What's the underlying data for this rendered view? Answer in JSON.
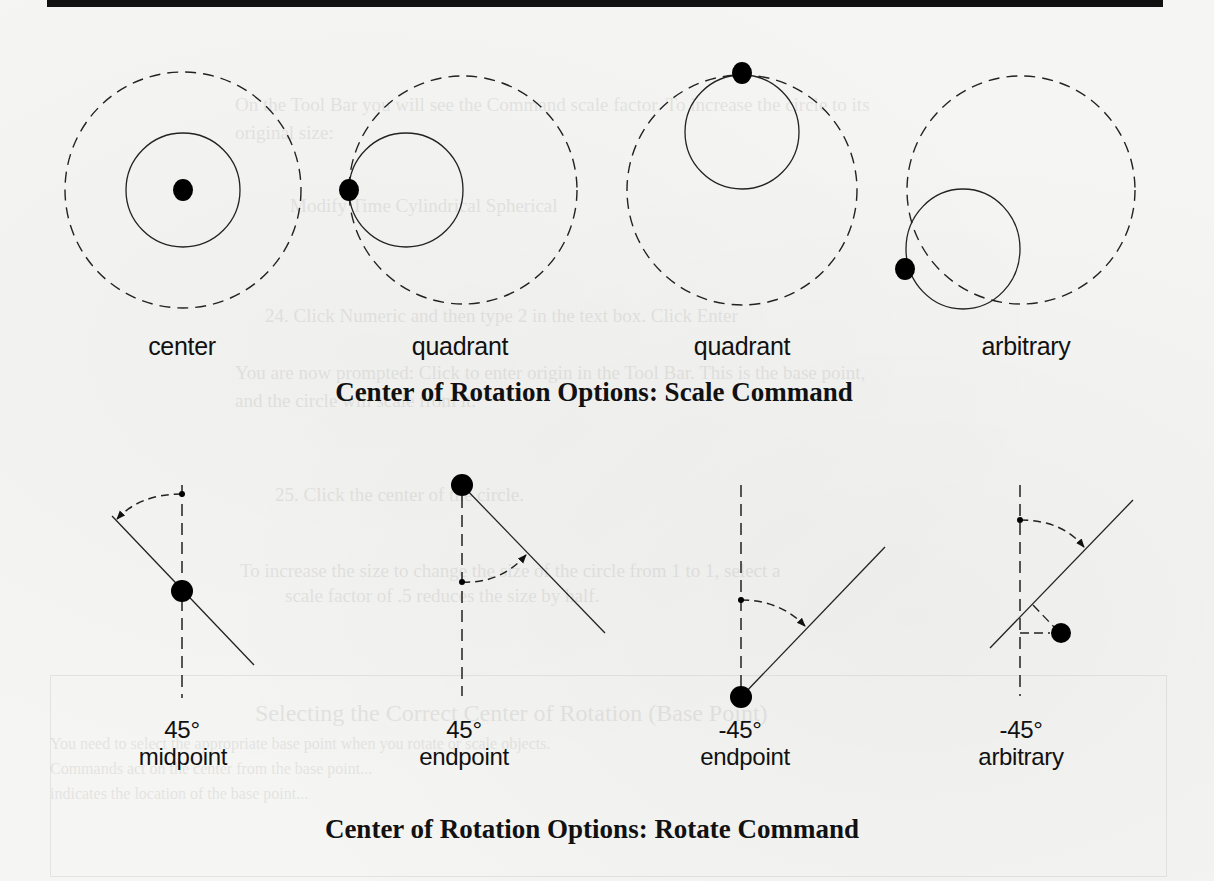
{
  "scale_section": {
    "title": "Center of Rotation Options: Scale Command",
    "figures": [
      {
        "label": "center",
        "outer_circle": {
          "cx": 183,
          "cy": 190,
          "r": 118
        },
        "inner_circle": {
          "cx": 183,
          "cy": 190,
          "r": 57
        },
        "base_point": {
          "x": 183,
          "y": 190
        }
      },
      {
        "label": "quadrant",
        "outer_circle": {
          "cx": 463,
          "cy": 190,
          "r": 114
        },
        "inner_circle": {
          "cx": 406,
          "cy": 190,
          "r": 57
        },
        "base_point": {
          "x": 349,
          "y": 190
        }
      },
      {
        "label": "quadrant",
        "outer_circle": {
          "cx": 742,
          "cy": 190,
          "r": 115
        },
        "inner_circle": {
          "cx": 742,
          "cy": 133,
          "r": 57
        },
        "base_point": {
          "x": 742,
          "y": 73
        }
      },
      {
        "label": "arbitrary",
        "outer_circle": {
          "cx": 1021,
          "cy": 190,
          "r": 114
        },
        "inner_circle": {
          "cx": 963,
          "cy": 249,
          "r": 57
        },
        "base_point": {
          "x": 905,
          "y": 269
        }
      }
    ]
  },
  "rotate_section": {
    "title": "Center of Rotation Options: Rotate Command",
    "figures": [
      {
        "angle": "45°",
        "label": "midpoint"
      },
      {
        "angle": "45°",
        "label": "endpoint"
      },
      {
        "angle": "-45°",
        "label": "endpoint"
      },
      {
        "angle": "-45°",
        "label": "arbitrary"
      }
    ]
  },
  "bleed_through": {
    "lines": [
      "On the Tool Bar you will see the Command scale factor. To increase the circle to its",
      "original size:",
      "Modify Time       Cylindrical    Spherical",
      "24. Click Numeric and then type 2 in the text box. Click Enter",
      "You are now prompted: Click to enter origin in the Tool Bar. This is the base point,",
      "and the circle will scale from it.",
      "25. Click the center of the circle.",
      "To increase the size to change the size of the circle from 1 to 1, select a",
      "scale factor of .5 reduces the size by half.",
      "Selecting the Correct Center of Rotation (Base Point)",
      "You need to select the appropriate base point when you rotate or scale objects.",
      "Commands act on the center from the base point...",
      "indicates the location of the base point..."
    ]
  }
}
